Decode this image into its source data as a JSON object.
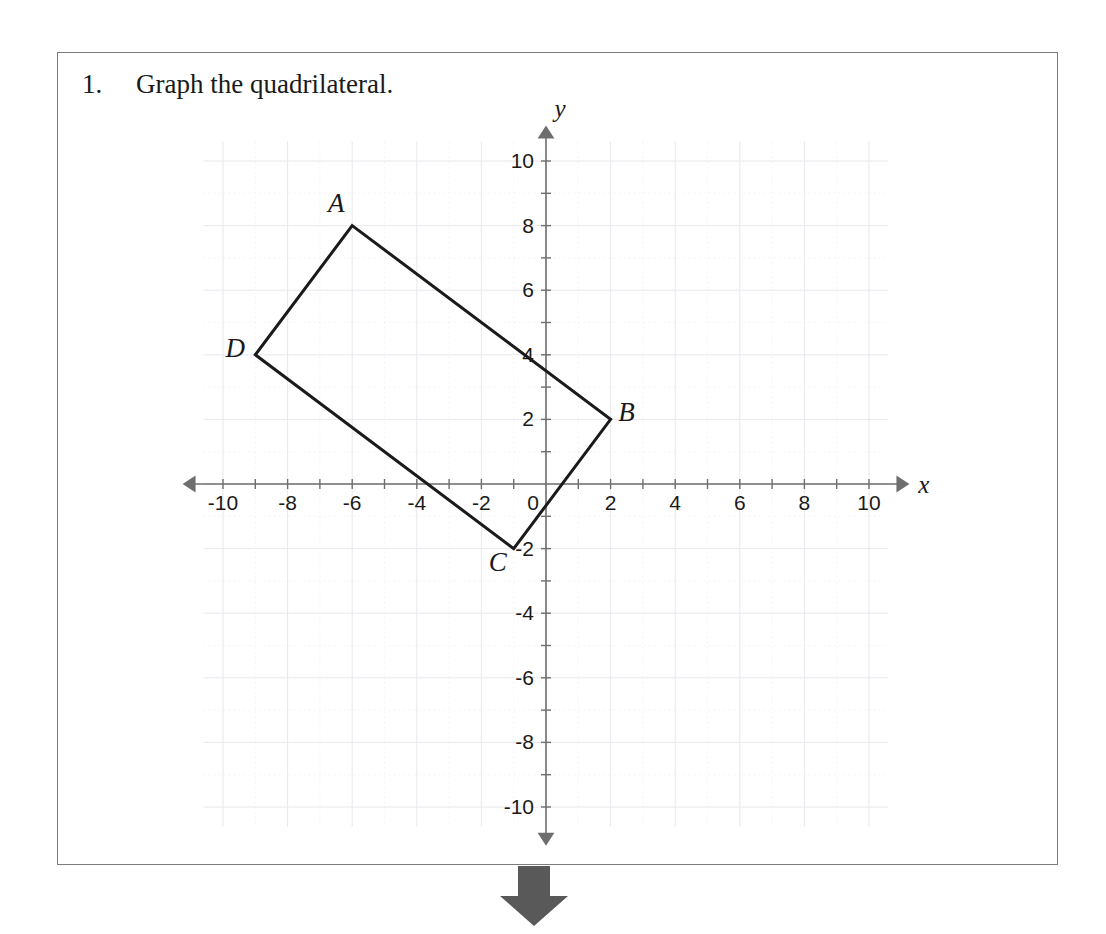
{
  "page": {
    "background_color": "#ffffff",
    "border_color": "#7c7c7c"
  },
  "problem": {
    "number": "1.",
    "text": "Graph the quadrilateral."
  },
  "flow_arrow": {
    "name": "down-arrow",
    "color": "#595959",
    "direction": "down"
  },
  "chart_data": {
    "type": "scatter",
    "title": "",
    "xlabel": "x",
    "ylabel": "y",
    "xlim": [
      -11,
      11
    ],
    "ylim": [
      -11,
      11
    ],
    "grid": true,
    "grid_step": 1,
    "tick_step": 1,
    "label_step": 2,
    "axis_color": "#6e6e6e",
    "grid_color": "#e8e8ee",
    "shape_color": "#1a1a1a",
    "x_tick_labels": [
      "-10",
      "-8",
      "-6",
      "-4",
      "-2",
      "0",
      "2",
      "4",
      "6",
      "8",
      "10"
    ],
    "x_tick_values": [
      -10,
      -8,
      -6,
      -4,
      -2,
      0,
      2,
      4,
      6,
      8,
      10
    ],
    "y_tick_labels": [
      "10",
      "8",
      "6",
      "4",
      "2",
      "-2",
      "-4",
      "-6",
      "-8",
      "-10"
    ],
    "y_tick_values": [
      10,
      8,
      6,
      4,
      2,
      -2,
      -4,
      -6,
      -8,
      -10
    ],
    "origin_label": "0",
    "series": [
      {
        "name": "quadrilateral ABCD",
        "closed": true,
        "points": [
          {
            "label": "A",
            "x": -6,
            "y": 8,
            "label_dx": -16,
            "label_dy": -14
          },
          {
            "label": "B",
            "x": 2,
            "y": 2,
            "label_dx": 16,
            "label_dy": 2
          },
          {
            "label": "C",
            "x": -1,
            "y": -2,
            "label_dx": -16,
            "label_dy": 22
          },
          {
            "label": "D",
            "x": -9,
            "y": 4,
            "label_dx": -20,
            "label_dy": 2
          }
        ]
      }
    ]
  }
}
